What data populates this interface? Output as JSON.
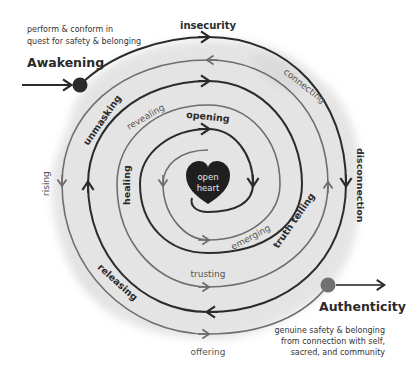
{
  "start": {
    "title": "Awakening",
    "caption_lines": [
      "perform & conform in",
      "quest for safety & belonging"
    ]
  },
  "end": {
    "title": "Authenticity",
    "caption_lines": [
      "genuine safety & belonging",
      "from connection with self,",
      "sacred, and community"
    ]
  },
  "center": {
    "label_lines": [
      "open",
      "heart"
    ]
  },
  "stages": {
    "insecurity": "insecurity",
    "connecting": "connecting",
    "disconnection": "disconnection",
    "truth_telling": "truth telling",
    "emerging": "emerging",
    "trusting": "trusting",
    "offering": "offering",
    "releasing": "releasing",
    "rising": "rising",
    "healing": "healing",
    "unmasking": "unmasking",
    "revealing": "revealing",
    "opening": "opening"
  },
  "colors": {
    "dark_path": "#2b2b2b",
    "light_path": "#6e6e6e",
    "wash": "#d9d9d9",
    "heart": "#1f1f1f",
    "start_dot": "#2b2b2b",
    "end_dot": "#707070"
  }
}
